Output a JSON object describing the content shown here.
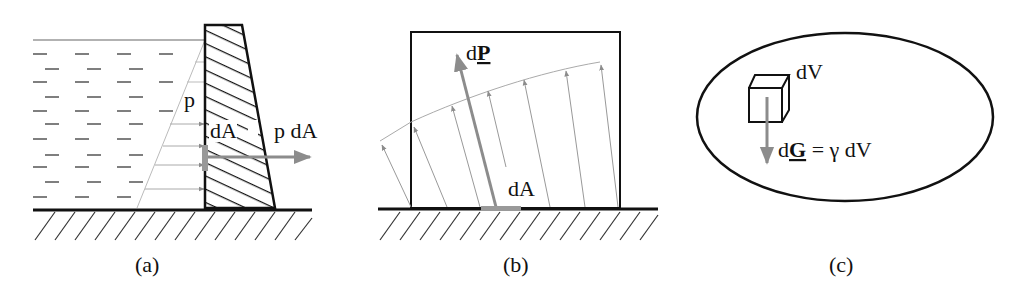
{
  "panels": {
    "a": {
      "caption": "(a)",
      "labels": {
        "pressure": "p",
        "area": "dA",
        "force": "p dA"
      }
    },
    "b": {
      "caption": "(b)",
      "labels": {
        "force_prefix": "d",
        "force_vector": "P",
        "area": "dA"
      }
    },
    "c": {
      "caption": "(c)",
      "labels": {
        "volume": "dV",
        "weight_prefix": "d",
        "weight_vector": "G",
        "equation_rest": " = γ dV"
      }
    }
  },
  "colors": {
    "line": "#111111",
    "arrow": "#8c8c8c",
    "thin": "#aaaaaa"
  }
}
